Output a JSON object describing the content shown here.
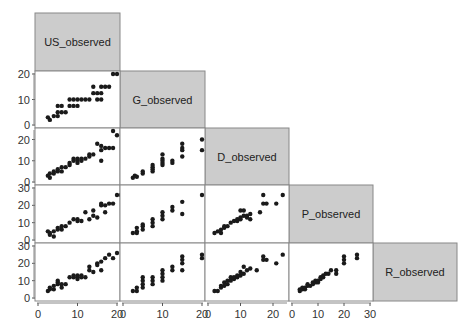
{
  "chart_data": {
    "type": "scatter",
    "subtype": "scatterplot-matrix-lower-triangle",
    "variables": [
      "US_observed",
      "G_observed",
      "D_observed",
      "P_observed",
      "R_observed"
    ],
    "axis_ranges": {
      "US_observed": [
        0,
        20
      ],
      "G_observed": [
        0,
        20
      ],
      "D_observed": [
        0,
        24
      ],
      "P_observed": [
        0,
        30
      ],
      "R_observed": [
        0,
        30
      ]
    },
    "x_ticks": {
      "US_observed": [
        0,
        10,
        20
      ],
      "G_observed": [
        0,
        10,
        20
      ],
      "D_observed": [
        0,
        10,
        20
      ],
      "P_observed": [
        0,
        10,
        20,
        30
      ]
    },
    "y_ticks": {
      "G_observed": [
        0,
        10,
        20
      ],
      "D_observed": [
        0,
        10,
        20
      ],
      "P_observed": [
        0,
        10,
        20,
        30
      ],
      "R_observed": [
        0,
        10,
        20,
        30
      ]
    },
    "header_color": "#cccccc",
    "point_color": "#1a1a1a",
    "panels": [
      {
        "x": "US_observed",
        "y": "G_observed",
        "points": [
          [
            2.5,
            3
          ],
          [
            3,
            2
          ],
          [
            4,
            3.5
          ],
          [
            5,
            3.5
          ],
          [
            5,
            5
          ],
          [
            5,
            7.5
          ],
          [
            6,
            5
          ],
          [
            6,
            7.5
          ],
          [
            7,
            5
          ],
          [
            8,
            7.5
          ],
          [
            8,
            10
          ],
          [
            9,
            7.5
          ],
          [
            9,
            10
          ],
          [
            10,
            7.5
          ],
          [
            10,
            10
          ],
          [
            11,
            10
          ],
          [
            12,
            10
          ],
          [
            13,
            10
          ],
          [
            14,
            12.5
          ],
          [
            14,
            15
          ],
          [
            15,
            10
          ],
          [
            15,
            12.5
          ],
          [
            16,
            15
          ],
          [
            16,
            10
          ],
          [
            16,
            12.5
          ],
          [
            17,
            15
          ],
          [
            18,
            15
          ],
          [
            19,
            20
          ],
          [
            20,
            20
          ]
        ]
      },
      {
        "x": "US_observed",
        "y": "D_observed",
        "points": [
          [
            2.5,
            3
          ],
          [
            3,
            2
          ],
          [
            3,
            4
          ],
          [
            4,
            4
          ],
          [
            4,
            5
          ],
          [
            5,
            5
          ],
          [
            5,
            6
          ],
          [
            6,
            5
          ],
          [
            6,
            7
          ],
          [
            7,
            7
          ],
          [
            8,
            8
          ],
          [
            8,
            9
          ],
          [
            9,
            10
          ],
          [
            9,
            11
          ],
          [
            10,
            9
          ],
          [
            10,
            10
          ],
          [
            10,
            11
          ],
          [
            11,
            11
          ],
          [
            11,
            10
          ],
          [
            12,
            11
          ],
          [
            13,
            12
          ],
          [
            13,
            13
          ],
          [
            14,
            13
          ],
          [
            15,
            18
          ],
          [
            16,
            15
          ],
          [
            16,
            10
          ],
          [
            16,
            17
          ],
          [
            17,
            16
          ],
          [
            18,
            16
          ],
          [
            19,
            16
          ],
          [
            20,
            22
          ],
          [
            19,
            24
          ]
        ]
      },
      {
        "x": "US_observed",
        "y": "P_observed",
        "points": [
          [
            2.5,
            5
          ],
          [
            3,
            4
          ],
          [
            3,
            3
          ],
          [
            4,
            5
          ],
          [
            4,
            2
          ],
          [
            5,
            6
          ],
          [
            5,
            7
          ],
          [
            6,
            8
          ],
          [
            6,
            6
          ],
          [
            7,
            8
          ],
          [
            8,
            10
          ],
          [
            9,
            12
          ],
          [
            10,
            12
          ],
          [
            10,
            11
          ],
          [
            11,
            11
          ],
          [
            12,
            16
          ],
          [
            13,
            12
          ],
          [
            14,
            14
          ],
          [
            14,
            17
          ],
          [
            15,
            13
          ],
          [
            16,
            20
          ],
          [
            16,
            21
          ],
          [
            17,
            20
          ],
          [
            17,
            16
          ],
          [
            18,
            21
          ],
          [
            19,
            21
          ],
          [
            20,
            26
          ],
          [
            21,
            26
          ]
        ]
      },
      {
        "x": "US_observed",
        "y": "R_observed",
        "points": [
          [
            2.5,
            4
          ],
          [
            3,
            5
          ],
          [
            3,
            6
          ],
          [
            4,
            5
          ],
          [
            4,
            7
          ],
          [
            5,
            8
          ],
          [
            5,
            9
          ],
          [
            5,
            10
          ],
          [
            6,
            8
          ],
          [
            6,
            6
          ],
          [
            7,
            8
          ],
          [
            8,
            12
          ],
          [
            9,
            12
          ],
          [
            9,
            13
          ],
          [
            10,
            12
          ],
          [
            10,
            13
          ],
          [
            10,
            11
          ],
          [
            11,
            13
          ],
          [
            11,
            12
          ],
          [
            12,
            12
          ],
          [
            13,
            16
          ],
          [
            13,
            18
          ],
          [
            14,
            15
          ],
          [
            15,
            19
          ],
          [
            15,
            20
          ],
          [
            16,
            21
          ],
          [
            16,
            16
          ],
          [
            17,
            23
          ],
          [
            18,
            25
          ],
          [
            19,
            23
          ],
          [
            20,
            26
          ]
        ]
      },
      {
        "x": "G_observed",
        "y": "D_observed",
        "points": [
          [
            2.5,
            2
          ],
          [
            3,
            3
          ],
          [
            3.5,
            2.5
          ],
          [
            5,
            4
          ],
          [
            5,
            5
          ],
          [
            7.5,
            5
          ],
          [
            7.5,
            6
          ],
          [
            7.5,
            7
          ],
          [
            7.5,
            8
          ],
          [
            10,
            8
          ],
          [
            10,
            9
          ],
          [
            10,
            10
          ],
          [
            10,
            11
          ],
          [
            10,
            13
          ],
          [
            12.5,
            9
          ],
          [
            12.5,
            10
          ],
          [
            15,
            12
          ],
          [
            15,
            15
          ],
          [
            15,
            16
          ],
          [
            15,
            18
          ],
          [
            20,
            15
          ],
          [
            20,
            20
          ]
        ]
      },
      {
        "x": "G_observed",
        "y": "P_observed",
        "points": [
          [
            2.5,
            4
          ],
          [
            3.5,
            4
          ],
          [
            3.5,
            5
          ],
          [
            3.5,
            7
          ],
          [
            5,
            6
          ],
          [
            5,
            8
          ],
          [
            5,
            9
          ],
          [
            7.5,
            8
          ],
          [
            7.5,
            10
          ],
          [
            7.5,
            12
          ],
          [
            10,
            12
          ],
          [
            10,
            14
          ],
          [
            10,
            16
          ],
          [
            12.5,
            17
          ],
          [
            12.5,
            19
          ],
          [
            15,
            15
          ],
          [
            15,
            22
          ],
          [
            20,
            26
          ]
        ]
      },
      {
        "x": "G_observed",
        "y": "R_observed",
        "points": [
          [
            2.5,
            4
          ],
          [
            3.5,
            4
          ],
          [
            3.5,
            6
          ],
          [
            5,
            6
          ],
          [
            5,
            8
          ],
          [
            5,
            10
          ],
          [
            5,
            12
          ],
          [
            7.5,
            8
          ],
          [
            7.5,
            10
          ],
          [
            7.5,
            12
          ],
          [
            10,
            10
          ],
          [
            10,
            12
          ],
          [
            10,
            14
          ],
          [
            10,
            16
          ],
          [
            12.5,
            16
          ],
          [
            12.5,
            18
          ],
          [
            15,
            16
          ],
          [
            15,
            20
          ],
          [
            15,
            22
          ],
          [
            15,
            24
          ],
          [
            20,
            23
          ],
          [
            20,
            25
          ]
        ]
      },
      {
        "x": "D_observed",
        "y": "P_observed",
        "points": [
          [
            2,
            4
          ],
          [
            3,
            5
          ],
          [
            4,
            4
          ],
          [
            4,
            6
          ],
          [
            5,
            7
          ],
          [
            5,
            8
          ],
          [
            6,
            8
          ],
          [
            7,
            10
          ],
          [
            8,
            11
          ],
          [
            9,
            11
          ],
          [
            9,
            12
          ],
          [
            10,
            12
          ],
          [
            10,
            13
          ],
          [
            10,
            17
          ],
          [
            11,
            17
          ],
          [
            11,
            14
          ],
          [
            12,
            14
          ],
          [
            12,
            13
          ],
          [
            13,
            12
          ],
          [
            13,
            15
          ],
          [
            16,
            16
          ],
          [
            17,
            21
          ],
          [
            17,
            26
          ],
          [
            18,
            21
          ],
          [
            21,
            21
          ],
          [
            23,
            26
          ]
        ]
      },
      {
        "x": "D_observed",
        "y": "R_observed",
        "points": [
          [
            2,
            4
          ],
          [
            3,
            4
          ],
          [
            4,
            6
          ],
          [
            4,
            7
          ],
          [
            5,
            7
          ],
          [
            5,
            9
          ],
          [
            6,
            8
          ],
          [
            6,
            10
          ],
          [
            7,
            10
          ],
          [
            7,
            12
          ],
          [
            8,
            11
          ],
          [
            8,
            12
          ],
          [
            9,
            12
          ],
          [
            9,
            13
          ],
          [
            10,
            13
          ],
          [
            10,
            15
          ],
          [
            11,
            14
          ],
          [
            11,
            18
          ],
          [
            12,
            16
          ],
          [
            13,
            17
          ],
          [
            15,
            16
          ],
          [
            17,
            22
          ],
          [
            17,
            24
          ],
          [
            18,
            22
          ],
          [
            21,
            20
          ],
          [
            23,
            25
          ]
        ]
      },
      {
        "x": "P_observed",
        "y": "R_observed",
        "points": [
          [
            3,
            4
          ],
          [
            3,
            5
          ],
          [
            4,
            5
          ],
          [
            4,
            6
          ],
          [
            5,
            5
          ],
          [
            5,
            6
          ],
          [
            6,
            7
          ],
          [
            6,
            8
          ],
          [
            7,
            7
          ],
          [
            8,
            8
          ],
          [
            8,
            9
          ],
          [
            9,
            9
          ],
          [
            9,
            10
          ],
          [
            10,
            9
          ],
          [
            10,
            10
          ],
          [
            11,
            11
          ],
          [
            11,
            12
          ],
          [
            12,
            12
          ],
          [
            12,
            13
          ],
          [
            13,
            14
          ],
          [
            14,
            14
          ],
          [
            15,
            16
          ],
          [
            17,
            14
          ],
          [
            17,
            16
          ],
          [
            20,
            20
          ],
          [
            20,
            22
          ],
          [
            20,
            24
          ],
          [
            25,
            23
          ],
          [
            25,
            25
          ]
        ]
      }
    ]
  }
}
